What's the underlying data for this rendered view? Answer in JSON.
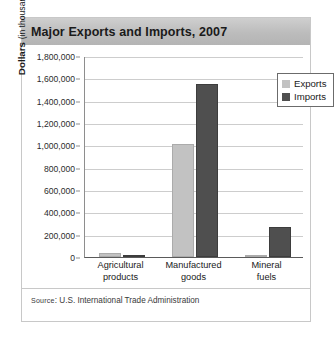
{
  "figure": {
    "title": "Major Exports and Imports, 2007",
    "source_prefix": "Source",
    "source_text": ": U.S. International Trade Administration"
  },
  "chart_data": {
    "type": "bar",
    "title": "Major Exports and Imports, 2007",
    "xlabel": "",
    "ylabel": "Dollars (in thousands)",
    "ylabel_bold_part": "Dollars",
    "ylabel_regular_part": "(in thousands)",
    "categories": [
      "Agricultural products",
      "Manufactured goods",
      "Mineral fuels"
    ],
    "category_labels": [
      "Agricultural\nproducts",
      "Manufactured\ngoods",
      "Mineral\nfuels"
    ],
    "series": [
      {
        "name": "Exports",
        "color": "#c2c2c2",
        "values": [
          40000,
          1010000,
          10000
        ]
      },
      {
        "name": "Imports",
        "color": "#4f4f4f",
        "values": [
          15000,
          1545000,
          270000
        ]
      }
    ],
    "ylim": [
      0,
      1800000
    ],
    "ytick_step": 200000,
    "ytick_labels": [
      "1,800,000",
      "1,600,000",
      "1,400,000",
      "1,200,000",
      "1,000,000",
      "800,000",
      "600,000",
      "400,000",
      "200,000",
      "0"
    ],
    "ytick_values": [
      1800000,
      1600000,
      1400000,
      1200000,
      1000000,
      800000,
      600000,
      400000,
      200000,
      0
    ],
    "grid": true,
    "legend_position": "top-right",
    "legend_entries": [
      "Exports",
      "Imports"
    ]
  }
}
